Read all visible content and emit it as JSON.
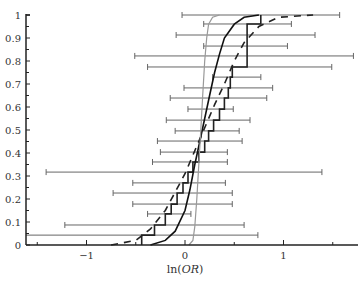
{
  "chart_data": {
    "type": "line",
    "title": "",
    "xlabel": "ln(OR)",
    "ylabel": "",
    "xlim": [
      -1.6,
      1.75
    ],
    "ylim": [
      0,
      1
    ],
    "grid": false,
    "legend": null,
    "x_ticks": [
      -1,
      0,
      1
    ],
    "x_tick_labels": [
      "−1",
      "0",
      "1"
    ],
    "x_minor_ticks": [
      -1.5,
      -0.5,
      0.5,
      1.5
    ],
    "y_ticks": [
      0,
      0.1,
      0.2,
      0.3,
      0.4,
      0.5,
      0.6,
      0.7,
      0.8,
      0.9,
      1
    ],
    "y_tick_labels": [
      "0",
      "0.1",
      "0.2",
      "0.3",
      "0.4",
      "0.5",
      "0.6",
      "0.7",
      "0.8",
      "0.9",
      "1"
    ],
    "error_bars": [
      {
        "y": 0.043,
        "lo": -1.62,
        "hi": 0.74
      },
      {
        "y": 0.087,
        "lo": -1.22,
        "hi": 0.6
      },
      {
        "y": 0.135,
        "lo": -0.38,
        "hi": 0.06
      },
      {
        "y": 0.178,
        "lo": -0.53,
        "hi": 0.48
      },
      {
        "y": 0.226,
        "lo": -0.73,
        "hi": 0.48
      },
      {
        "y": 0.27,
        "lo": -0.53,
        "hi": 0.41
      },
      {
        "y": 0.317,
        "lo": -1.41,
        "hi": 1.39
      },
      {
        "y": 0.361,
        "lo": -0.33,
        "hi": 0.43
      },
      {
        "y": 0.404,
        "lo": -0.25,
        "hi": 0.43
      },
      {
        "y": 0.452,
        "lo": -0.28,
        "hi": 0.58
      },
      {
        "y": 0.496,
        "lo": -0.1,
        "hi": 0.55
      },
      {
        "y": 0.543,
        "lo": -0.19,
        "hi": 0.66
      },
      {
        "y": 0.591,
        "lo": 0.03,
        "hi": 0.49
      },
      {
        "y": 0.639,
        "lo": -0.15,
        "hi": 0.83
      },
      {
        "y": 0.683,
        "lo": -0.01,
        "hi": 0.89
      },
      {
        "y": 0.73,
        "lo": 0.28,
        "hi": 0.77
      },
      {
        "y": 0.774,
        "lo": -0.38,
        "hi": 1.49
      },
      {
        "y": 0.822,
        "lo": -0.51,
        "hi": 1.71
      },
      {
        "y": 0.865,
        "lo": 0.19,
        "hi": 1.04
      },
      {
        "y": 0.913,
        "lo": -0.09,
        "hi": 1.32
      },
      {
        "y": 0.961,
        "lo": 0.19,
        "hi": 1.08
      },
      {
        "y": 1.0,
        "lo": -0.03,
        "hi": 1.57
      }
    ],
    "series": [
      {
        "name": "empirical-cdf-step",
        "style": "solid-step",
        "color": "#222222",
        "x": [
          -0.44,
          -0.44,
          -0.31,
          -0.31,
          -0.2,
          -0.2,
          -0.14,
          -0.14,
          -0.08,
          -0.08,
          -0.02,
          -0.02,
          0.03,
          0.03,
          0.08,
          0.08,
          0.14,
          0.14,
          0.2,
          0.2,
          0.24,
          0.24,
          0.29,
          0.29,
          0.35,
          0.35,
          0.4,
          0.4,
          0.44,
          0.44,
          0.46,
          0.46,
          0.48,
          0.48,
          0.63,
          0.63,
          0.63,
          0.63,
          0.77,
          0.77
        ],
        "y": [
          0,
          0.043,
          0.043,
          0.087,
          0.087,
          0.135,
          0.135,
          0.178,
          0.178,
          0.226,
          0.226,
          0.27,
          0.27,
          0.317,
          0.317,
          0.361,
          0.361,
          0.404,
          0.404,
          0.452,
          0.452,
          0.496,
          0.496,
          0.543,
          0.543,
          0.591,
          0.591,
          0.639,
          0.639,
          0.683,
          0.683,
          0.73,
          0.73,
          0.774,
          0.774,
          0.865,
          0.865,
          0.961,
          0.961,
          1.0
        ]
      },
      {
        "name": "fitted-cdf-dashed",
        "style": "dashed",
        "color": "#222222",
        "x": [
          -0.75,
          -0.5,
          -0.35,
          -0.2,
          -0.1,
          0.0,
          0.1,
          0.2,
          0.3,
          0.4,
          0.5,
          0.6,
          0.75,
          0.95,
          1.3
        ],
        "y": [
          0.0,
          0.02,
          0.07,
          0.15,
          0.23,
          0.31,
          0.41,
          0.51,
          0.61,
          0.7,
          0.8,
          0.88,
          0.95,
          0.99,
          1.0
        ]
      },
      {
        "name": "normal-cdf-solid",
        "style": "solid",
        "color": "#111111",
        "x": [
          -0.35,
          -0.2,
          -0.1,
          0.0,
          0.05,
          0.1,
          0.15,
          0.2,
          0.25,
          0.3,
          0.35,
          0.4,
          0.5,
          0.6,
          0.75
        ],
        "y": [
          0.0,
          0.02,
          0.06,
          0.15,
          0.24,
          0.35,
          0.45,
          0.55,
          0.65,
          0.75,
          0.83,
          0.9,
          0.96,
          0.99,
          1.0
        ]
      },
      {
        "name": "narrow-cdf-gray",
        "style": "solid",
        "color": "#999999",
        "x": [
          0.04,
          0.08,
          0.1,
          0.12,
          0.14,
          0.16,
          0.18,
          0.2,
          0.22,
          0.24,
          0.28,
          0.35
        ],
        "y": [
          0.0,
          0.02,
          0.08,
          0.2,
          0.35,
          0.5,
          0.65,
          0.8,
          0.9,
          0.96,
          0.99,
          1.0
        ]
      }
    ]
  }
}
